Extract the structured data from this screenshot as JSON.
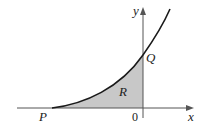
{
  "diagram": {
    "type": "region-under-curve",
    "labels": {
      "y_axis": "y",
      "x_axis": "x",
      "origin": "0",
      "point_q": "Q",
      "point_p": "P",
      "region": "R"
    },
    "colors": {
      "curve": "#1a1a1a",
      "axes": "#555555",
      "region_fill": "#c8c8c8",
      "background": "#ffffff"
    }
  }
}
